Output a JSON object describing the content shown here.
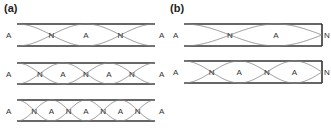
{
  "panels": [
    {
      "label": "(a)",
      "tube_type": "open-open",
      "rows": [
        {
          "labels": [
            "A",
            "N",
            "A",
            "N",
            "A"
          ]
        },
        {
          "labels": [
            "A",
            "N",
            "A",
            "N",
            "A",
            "N",
            "A"
          ]
        },
        {
          "labels": [
            "A",
            "N",
            "A",
            "N",
            "A",
            "N",
            "A",
            "N",
            "A"
          ]
        }
      ]
    },
    {
      "label": "(b)",
      "tube_type": "open-closed",
      "rows": [
        {
          "labels": [
            "A",
            "N",
            "A",
            "N"
          ]
        },
        {
          "labels": [
            "A",
            "N",
            "A",
            "N",
            "A",
            "N"
          ]
        }
      ]
    }
  ],
  "colors": {
    "wall": "#333333",
    "wave": "#888888",
    "text": "#333333"
  }
}
